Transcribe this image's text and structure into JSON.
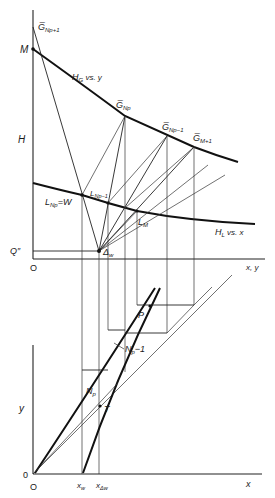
{
  "figure": {
    "top_plot": {
      "y_axis_label": "H",
      "x_axis_label": "x, y",
      "origin_label": "O",
      "curves": {
        "gas": "H_G vs. y",
        "liquid": "H_L vs. x"
      },
      "points": {
        "M": "M",
        "G_Np_plus_1": "G̅",
        "G_Np_plus_1_sub": "Np+1",
        "G_Np": "G̅",
        "G_Np_sub": "Np",
        "G_Np_minus_1": "G̅",
        "G_Np_minus_1_sub": "Np−1",
        "G_M_plus_1": "G̅",
        "G_M_plus_1_sub": "M+1",
        "L_Np_W": "L",
        "L_Np_W_sub": "Np",
        "L_Np_W_suffix": "=W",
        "L_Np_minus_1": "L",
        "L_Np_minus_1_sub": "Np−1",
        "L_M": "L",
        "L_M_sub": "M",
        "Q_double_prime": "Q″",
        "Delta_w": "Δ",
        "Delta_w_sub": "w"
      },
      "hg_label_main": "H",
      "hg_label_sub": "G",
      "hg_label_rest": " vs. y",
      "hl_label_main": "H",
      "hl_label_sub": "L",
      "hl_label_rest": " vs. x"
    },
    "bottom_plot": {
      "y_axis_label": "y",
      "x_axis_label": "x",
      "origin_label_y": "0",
      "origin_label_x": "O",
      "ticks": {
        "xw_main": "x",
        "xw_sub": "w",
        "xdw_main": "x",
        "xdw_sub": "Δw"
      },
      "points": {
        "P": "P",
        "T": "T",
        "Np": "N",
        "Np_sub": "p",
        "Np_minus_1_main": "N",
        "Np_minus_1_sub": "p",
        "Np_minus_1_suffix": "−1"
      }
    },
    "colors": {
      "ink": "#1a1a1a",
      "background": "#ffffff"
    }
  }
}
